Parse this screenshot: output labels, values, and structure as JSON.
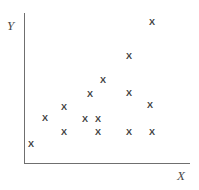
{
  "chart_data": {
    "type": "scatter",
    "title": "",
    "xlabel": "X",
    "ylabel": "Y",
    "marker": "x",
    "grid": false,
    "legend": null,
    "xlim": [
      0,
      100
    ],
    "ylim": [
      0,
      100
    ],
    "axis_ticks": {
      "x": [],
      "y": []
    },
    "points": [
      {
        "px": 31,
        "py": 144,
        "x": 4,
        "y": 13
      },
      {
        "px": 45,
        "py": 118,
        "x": 13,
        "y": 30
      },
      {
        "px": 64,
        "py": 107,
        "x": 24,
        "y": 37
      },
      {
        "px": 64,
        "py": 132,
        "x": 24,
        "y": 21
      },
      {
        "px": 85,
        "py": 119,
        "x": 37,
        "y": 29
      },
      {
        "px": 90,
        "py": 94,
        "x": 40,
        "y": 46
      },
      {
        "px": 98,
        "py": 119,
        "x": 45,
        "y": 29
      },
      {
        "px": 98,
        "py": 132,
        "x": 45,
        "y": 21
      },
      {
        "px": 103,
        "py": 80,
        "x": 48,
        "y": 55
      },
      {
        "px": 129,
        "py": 56,
        "x": 63,
        "y": 71
      },
      {
        "px": 129,
        "py": 93,
        "x": 63,
        "y": 47
      },
      {
        "px": 129,
        "py": 132,
        "x": 63,
        "y": 21
      },
      {
        "px": 150,
        "py": 105,
        "x": 76,
        "y": 39
      },
      {
        "px": 152,
        "py": 132,
        "x": 77,
        "y": 21
      },
      {
        "px": 152,
        "py": 22,
        "x": 77,
        "y": 93
      }
    ],
    "point_count": 15,
    "marker_glyph": "X",
    "colors": {
      "axis": "#6f6f6f",
      "marker": "#3d3d3d",
      "label": "#4a4a4a",
      "background": "#ffffff"
    }
  }
}
